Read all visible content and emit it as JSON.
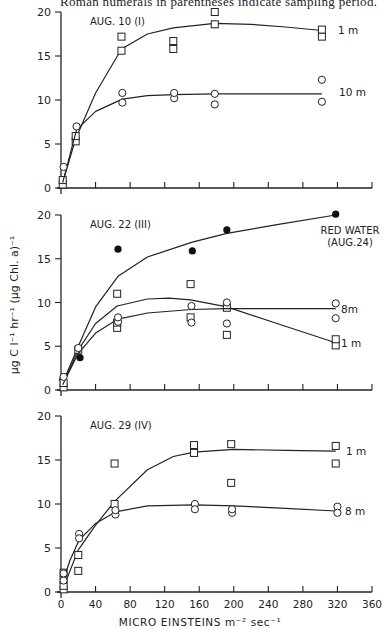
{
  "caption": "Roman numerals in parentheses indicate sampling period.",
  "y_axis_label": "μg C l⁻¹ hr⁻¹ (μg Chl. a)⁻¹",
  "x_axis_label": "MICRO EINSTEINS m⁻² sec⁻¹",
  "x_ticks": [
    "0",
    "40",
    "80",
    "120",
    "160",
    "200",
    "240",
    "280",
    "320",
    "360"
  ],
  "y_ticks": [
    "0",
    "5",
    "10",
    "15",
    "20"
  ],
  "chart_data": [
    {
      "type": "scatter",
      "title": "AUG. 10 (I)",
      "xlabel": "MICRO EINSTEINS m⁻² sec⁻¹",
      "ylabel": "μg C l⁻¹ hr⁻¹ (μg Chl. a)⁻¹",
      "xlim": [
        0,
        360
      ],
      "ylim": [
        0,
        20
      ],
      "grid": false,
      "series": [
        {
          "name": "1 m",
          "marker": "open-square",
          "points": [
            [
              2,
              0.4
            ],
            [
              2,
              0.9
            ],
            [
              17,
              5.3
            ],
            [
              17,
              5.9
            ],
            [
              70,
              15.6
            ],
            [
              70,
              17.2
            ],
            [
              130,
              15.8
            ],
            [
              130,
              16.7
            ],
            [
              178,
              18.6
            ],
            [
              178,
              20.0
            ],
            [
              302,
              17.2
            ],
            [
              302,
              18.0
            ]
          ],
          "fit": [
            [
              2,
              0.6
            ],
            [
              17,
              5.6
            ],
            [
              40,
              10.8
            ],
            [
              70,
              15.8
            ],
            [
              100,
              17.5
            ],
            [
              130,
              18.2
            ],
            [
              178,
              18.7
            ],
            [
              220,
              18.6
            ],
            [
              260,
              18.3
            ],
            [
              302,
              17.9
            ]
          ],
          "label": "1 m"
        },
        {
          "name": "10 m",
          "marker": "open-circle",
          "points": [
            [
              3,
              2.4
            ],
            [
              18,
              7.0
            ],
            [
              71,
              9.7
            ],
            [
              71,
              10.8
            ],
            [
              131,
              10.2
            ],
            [
              131,
              10.8
            ],
            [
              178,
              9.5
            ],
            [
              178,
              10.7
            ],
            [
              302,
              9.8
            ],
            [
              302,
              12.3
            ]
          ],
          "fit": [
            [
              2,
              0.6
            ],
            [
              18,
              6.6
            ],
            [
              40,
              8.7
            ],
            [
              71,
              10.1
            ],
            [
              100,
              10.5
            ],
            [
              131,
              10.6
            ],
            [
              178,
              10.7
            ],
            [
              240,
              10.7
            ],
            [
              302,
              10.7
            ]
          ],
          "label": "10 m"
        }
      ]
    },
    {
      "type": "scatter",
      "title": "AUG. 22 (III)",
      "xlabel": "MICRO EINSTEINS m⁻² sec⁻¹",
      "ylabel": "μg C l⁻¹ hr⁻¹ (μg Chl. a)⁻¹",
      "xlim": [
        0,
        360
      ],
      "ylim": [
        0,
        20
      ],
      "grid": false,
      "annotation": "RED WATER (AUG.24)",
      "series": [
        {
          "name": "Red water (Aug. 24)",
          "marker": "filled-circle",
          "points": [
            [
              2,
              1.2
            ],
            [
              22,
              3.7
            ],
            [
              66,
              16.1
            ],
            [
              152,
              15.9
            ],
            [
              192,
              18.3
            ],
            [
              318,
              20.1
            ]
          ],
          "fit": [
            [
              2,
              0.8
            ],
            [
              20,
              5.0
            ],
            [
              40,
              9.5
            ],
            [
              66,
              13.0
            ],
            [
              100,
              15.2
            ],
            [
              152,
              16.9
            ],
            [
              192,
              17.9
            ],
            [
              250,
              18.9
            ],
            [
              318,
              20.0
            ]
          ],
          "label": "RED WATER (AUG.24)"
        },
        {
          "name": "1 m",
          "marker": "open-square",
          "points": [
            [
              3,
              0.3
            ],
            [
              3,
              0.8
            ],
            [
              20,
              4.6
            ],
            [
              65,
              7.1
            ],
            [
              65,
              7.7
            ],
            [
              65,
              11.0
            ],
            [
              150,
              8.3
            ],
            [
              150,
              12.1
            ],
            [
              192,
              6.3
            ],
            [
              192,
              9.4
            ],
            [
              318,
              5.1
            ],
            [
              318,
              5.8
            ]
          ],
          "fit": [
            [
              2,
              0.6
            ],
            [
              20,
              4.6
            ],
            [
              40,
              7.6
            ],
            [
              65,
              9.6
            ],
            [
              100,
              10.4
            ],
            [
              125,
              10.5
            ],
            [
              150,
              10.3
            ],
            [
              192,
              9.5
            ],
            [
              250,
              7.6
            ],
            [
              318,
              5.4
            ]
          ],
          "label": "1 m"
        },
        {
          "name": "8 m",
          "marker": "open-circle",
          "points": [
            [
              3,
              1.5
            ],
            [
              20,
              4.8
            ],
            [
              66,
              7.8
            ],
            [
              66,
              8.3
            ],
            [
              151,
              7.7
            ],
            [
              151,
              9.6
            ],
            [
              192,
              7.6
            ],
            [
              192,
              10.0
            ],
            [
              318,
              8.2
            ],
            [
              318,
              9.9
            ]
          ],
          "fit": [
            [
              2,
              0.6
            ],
            [
              20,
              4.2
            ],
            [
              40,
              6.5
            ],
            [
              66,
              8.1
            ],
            [
              100,
              8.8
            ],
            [
              151,
              9.2
            ],
            [
              192,
              9.3
            ],
            [
              250,
              9.3
            ],
            [
              318,
              9.3
            ]
          ],
          "label": "8m"
        }
      ]
    },
    {
      "type": "scatter",
      "title": "AUG. 29 (IV)",
      "xlabel": "MICRO EINSTEINS m⁻² sec⁻¹",
      "ylabel": "μg C l⁻¹ hr⁻¹ (μg Chl. a)⁻¹",
      "xlim": [
        0,
        360
      ],
      "ylim": [
        0,
        20
      ],
      "grid": false,
      "series": [
        {
          "name": "1 m",
          "marker": "open-square",
          "points": [
            [
              3,
              0.3
            ],
            [
              3,
              0.7
            ],
            [
              3,
              1.4
            ],
            [
              3,
              2.2
            ],
            [
              20,
              2.4
            ],
            [
              20,
              4.2
            ],
            [
              62,
              14.6
            ],
            [
              62,
              10.0
            ],
            [
              154,
              16.7
            ],
            [
              154,
              15.8
            ],
            [
              197,
              16.8
            ],
            [
              197,
              12.4
            ],
            [
              318,
              16.6
            ],
            [
              318,
              14.6
            ]
          ],
          "fit": [
            [
              2,
              0.3
            ],
            [
              20,
              4.8
            ],
            [
              40,
              7.6
            ],
            [
              62,
              10.3
            ],
            [
              100,
              13.9
            ],
            [
              130,
              15.4
            ],
            [
              154,
              15.9
            ],
            [
              200,
              16.2
            ],
            [
              260,
              16.1
            ],
            [
              318,
              16.0
            ]
          ],
          "label": "1 m"
        },
        {
          "name": "8 m",
          "marker": "open-circle",
          "points": [
            [
              3,
              1.3
            ],
            [
              3,
              2.1
            ],
            [
              21,
              6.6
            ],
            [
              21,
              6.1
            ],
            [
              63,
              8.8
            ],
            [
              63,
              9.3
            ],
            [
              155,
              10.0
            ],
            [
              155,
              9.4
            ],
            [
              198,
              9.0
            ],
            [
              198,
              9.4
            ],
            [
              320,
              9.7
            ],
            [
              320,
              9.0
            ]
          ],
          "fit": [
            [
              2,
              1.0
            ],
            [
              10,
              3.5
            ],
            [
              21,
              5.9
            ],
            [
              40,
              7.8
            ],
            [
              63,
              9.1
            ],
            [
              100,
              9.8
            ],
            [
              155,
              9.9
            ],
            [
              200,
              9.8
            ],
            [
              260,
              9.5
            ],
            [
              318,
              9.2
            ]
          ],
          "label": "8 m"
        }
      ]
    }
  ]
}
